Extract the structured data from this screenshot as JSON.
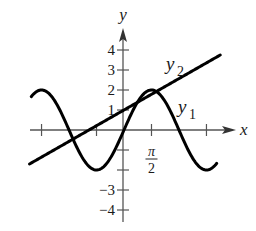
{
  "chart_data": {
    "type": "line",
    "title": "",
    "xlabel": "x",
    "ylabel": "y",
    "xlim": [
      -5.4,
      5.6
    ],
    "ylim": [
      -4.4,
      4.8
    ],
    "grid": false,
    "legend": "inline labels",
    "x_ticks": [
      {
        "value": -4.712,
        "label": ""
      },
      {
        "value": -1.571,
        "label": ""
      },
      {
        "value": 1.571,
        "label": "π/2",
        "num": "π",
        "den": "2"
      },
      {
        "value": 4.712,
        "label": ""
      }
    ],
    "y_ticks": [
      {
        "value": 4,
        "label": "4"
      },
      {
        "value": 3,
        "label": "3"
      },
      {
        "value": 2,
        "label": "2"
      },
      {
        "value": 1,
        "label": "1"
      },
      {
        "value": -1,
        "label": ""
      },
      {
        "value": -2,
        "label": ""
      },
      {
        "value": -3,
        "label": "−3"
      },
      {
        "value": -4,
        "label": "−4"
      }
    ],
    "series": [
      {
        "name": "y1",
        "label_main": "y",
        "label_sub": "1",
        "expression": "2 sin x",
        "domain": [
          -5.3,
          5.3
        ],
        "color": "#000000"
      },
      {
        "name": "y2",
        "label_main": "y",
        "label_sub": "2",
        "expression": "0.5 x + 1",
        "domain": [
          -5.4,
          5.5
        ],
        "color": "#000000"
      }
    ]
  }
}
